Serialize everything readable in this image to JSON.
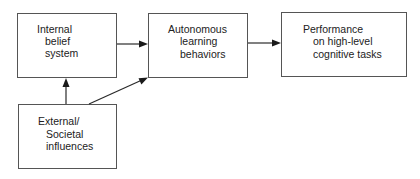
{
  "diagram": {
    "type": "flowchart",
    "nodes": [
      {
        "id": "internal",
        "lines": [
          "Internal",
          "belief",
          "system"
        ]
      },
      {
        "id": "autonomous",
        "lines": [
          "Autonomous",
          "learning",
          "behaviors"
        ]
      },
      {
        "id": "performance",
        "lines": [
          "Performance",
          "on high-level",
          "cognitive tasks"
        ]
      },
      {
        "id": "external",
        "lines": [
          "External/",
          "Societal",
          "influences"
        ]
      }
    ],
    "edges": [
      {
        "from": "internal",
        "to": "autonomous"
      },
      {
        "from": "autonomous",
        "to": "performance"
      },
      {
        "from": "external",
        "to": "internal"
      },
      {
        "from": "external",
        "to": "autonomous"
      }
    ],
    "colors": {
      "border": "#555555",
      "arrow": "#1a1a1a",
      "text": "#222222",
      "background": "#ffffff"
    }
  }
}
